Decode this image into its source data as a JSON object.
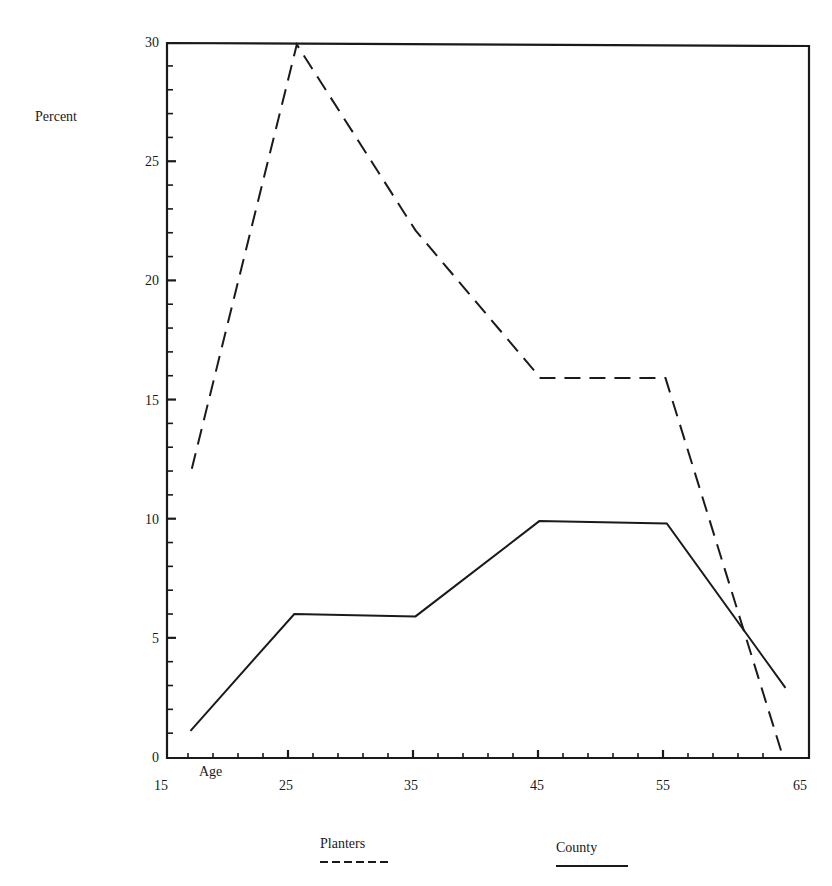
{
  "chart_data": {
    "type": "line",
    "title": "",
    "xlabel": "Age",
    "ylabel": "Percent",
    "xlim": [
      15,
      65
    ],
    "ylim": [
      0,
      30
    ],
    "x_ticks_major": [
      15,
      25,
      35,
      45,
      55,
      65
    ],
    "x_tick_labels": [
      "15",
      "25",
      "35",
      "45",
      "55",
      "65"
    ],
    "x_minor_step": 2,
    "y_ticks_major": [
      0,
      5,
      10,
      15,
      20,
      25,
      30
    ],
    "y_tick_labels": [
      "0",
      "5",
      "10",
      "15",
      "20",
      "25",
      "30"
    ],
    "y_minor_step": 1,
    "grid": false,
    "legend_position": "bottom",
    "series": [
      {
        "name": "Planters",
        "style": "dashed",
        "color": "#1a1a1a",
        "x": [
          17.3,
          25.7,
          35.2,
          45.2,
          55.2,
          64.6
        ],
        "values": [
          12.1,
          29.9,
          22.1,
          15.9,
          15.9,
          0
        ]
      },
      {
        "name": "County",
        "style": "solid",
        "color": "#1a1a1a",
        "x": [
          17.2,
          25.5,
          35.2,
          45.1,
          55.3,
          64.8
        ],
        "values": [
          1.1,
          6.0,
          5.9,
          9.9,
          9.8,
          2.9
        ]
      }
    ]
  },
  "axes": {
    "ylabel": "Percent",
    "xlabel": "Age"
  },
  "legend": {
    "items": [
      {
        "label": "Planters",
        "style": "dashed"
      },
      {
        "label": "County",
        "style": "solid"
      }
    ]
  }
}
